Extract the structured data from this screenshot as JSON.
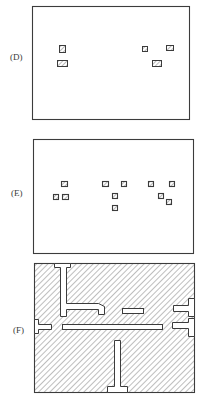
{
  "figure": {
    "panels": [
      {
        "id": "D",
        "label": "(D)",
        "frame": {
          "x": 32,
          "y": 6,
          "w": 157,
          "h": 113
        },
        "blocks": [
          {
            "x": 59,
            "y": 45,
            "w": 6,
            "h": 7,
            "hatched": true
          },
          {
            "x": 57,
            "y": 60,
            "w": 10,
            "h": 6,
            "hatched": true
          },
          {
            "x": 142,
            "y": 46,
            "w": 5,
            "h": 5,
            "hatched": true
          },
          {
            "x": 166,
            "y": 45,
            "w": 7,
            "h": 5,
            "hatched": true
          },
          {
            "x": 152,
            "y": 60,
            "w": 9,
            "h": 6,
            "hatched": true
          }
        ]
      },
      {
        "id": "E",
        "label": "(E)",
        "frame": {
          "x": 33,
          "y": 139,
          "w": 160,
          "h": 114
        },
        "blocks": [
          {
            "x": 61,
            "y": 181,
            "w": 6,
            "h": 5
          },
          {
            "x": 53,
            "y": 194,
            "w": 5,
            "h": 5
          },
          {
            "x": 62,
            "y": 194,
            "w": 6,
            "h": 5
          },
          {
            "x": 102,
            "y": 181,
            "w": 6,
            "h": 5
          },
          {
            "x": 121,
            "y": 181,
            "w": 5,
            "h": 5
          },
          {
            "x": 112,
            "y": 193,
            "w": 5,
            "h": 5
          },
          {
            "x": 112,
            "y": 205,
            "w": 5,
            "h": 5
          },
          {
            "x": 148,
            "y": 181,
            "w": 5,
            "h": 5
          },
          {
            "x": 169,
            "y": 181,
            "w": 5,
            "h": 5
          },
          {
            "x": 158,
            "y": 193,
            "w": 5,
            "h": 5
          },
          {
            "x": 166,
            "y": 199,
            "w": 5,
            "h": 5
          }
        ]
      },
      {
        "id": "F",
        "label": "(F)",
        "frame": {
          "x": 34,
          "y": 263,
          "w": 160,
          "h": 129
        },
        "hatched_fill": true
      }
    ],
    "colors": {
      "line": "#3c3c3c",
      "hatch": "#6e6e6e",
      "background": "#ffffff",
      "label": "#3a3a3a"
    }
  }
}
